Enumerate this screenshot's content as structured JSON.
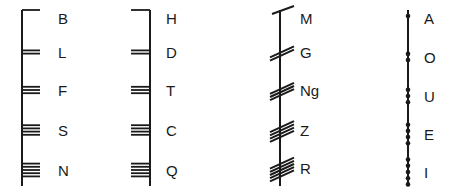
{
  "diagram": {
    "colors": {
      "ink": "#1a1a1a",
      "background": "#ffffff"
    },
    "groups": [
      {
        "id": "aicme-beithe",
        "stroke_style": "right",
        "stem_x": 22,
        "letters": [
          {
            "label": "B",
            "count": 1,
            "y": 18
          },
          {
            "label": "L",
            "count": 2,
            "y": 52
          },
          {
            "label": "F",
            "count": 3,
            "y": 90
          },
          {
            "label": "S",
            "count": 4,
            "y": 130
          },
          {
            "label": "N",
            "count": 5,
            "y": 170
          }
        ]
      },
      {
        "id": "aicme-huatha",
        "stroke_style": "left",
        "stem_x": 150,
        "letters": [
          {
            "label": "H",
            "count": 1,
            "y": 18
          },
          {
            "label": "D",
            "count": 2,
            "y": 52
          },
          {
            "label": "T",
            "count": 3,
            "y": 90
          },
          {
            "label": "C",
            "count": 4,
            "y": 130
          },
          {
            "label": "Q",
            "count": 5,
            "y": 170
          }
        ]
      },
      {
        "id": "aicme-muine",
        "stroke_style": "diagonal",
        "stem_x": 280,
        "letters": [
          {
            "label": "M",
            "count": 1,
            "y": 18
          },
          {
            "label": "G",
            "count": 2,
            "y": 52
          },
          {
            "label": "Ng",
            "count": 3,
            "y": 90
          },
          {
            "label": "Z",
            "count": 4,
            "y": 130
          },
          {
            "label": "R",
            "count": 5,
            "y": 168
          }
        ]
      },
      {
        "id": "aicme-ailme",
        "stroke_style": "dots",
        "stem_x": 408,
        "letters": [
          {
            "label": "A",
            "count": 1,
            "y": 18
          },
          {
            "label": "O",
            "count": 2,
            "y": 57
          },
          {
            "label": "U",
            "count": 3,
            "y": 96
          },
          {
            "label": "E",
            "count": 4,
            "y": 134
          },
          {
            "label": "I",
            "count": 5,
            "y": 172
          }
        ]
      }
    ]
  }
}
